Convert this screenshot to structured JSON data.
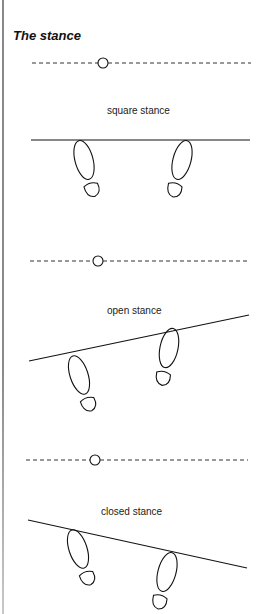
{
  "title": "The stance",
  "stances": [
    {
      "label": "square stance"
    },
    {
      "label": "open stance"
    },
    {
      "label": "closed stance"
    }
  ],
  "colors": {
    "line": "#111111",
    "dashed": "#333333",
    "border": "#888888"
  }
}
